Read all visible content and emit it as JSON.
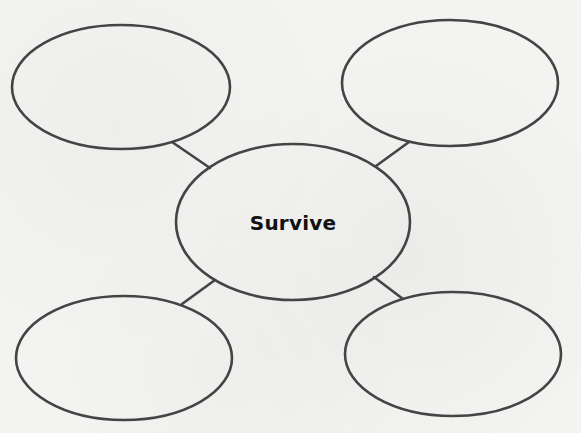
{
  "diagram": {
    "type": "bubble-map",
    "stroke_color": "#444444",
    "background_color": "#f3f3f1",
    "center": {
      "label": "Survive",
      "cx": 293,
      "cy": 222,
      "rx": 117,
      "ry": 78
    },
    "bubbles": [
      {
        "id": "top-left",
        "label": "",
        "cx": 121,
        "cy": 87,
        "rx": 109,
        "ry": 62
      },
      {
        "id": "top-right",
        "label": "",
        "cx": 450,
        "cy": 83,
        "rx": 108,
        "ry": 63
      },
      {
        "id": "bottom-left",
        "label": "",
        "cx": 124,
        "cy": 358,
        "rx": 108,
        "ry": 62
      },
      {
        "id": "bottom-right",
        "label": "",
        "cx": 453,
        "cy": 354,
        "rx": 108,
        "ry": 62
      }
    ],
    "connectors": [
      {
        "from": "top-left",
        "x1": 172,
        "y1": 142,
        "x2": 210,
        "y2": 168
      },
      {
        "from": "top-right",
        "x1": 409,
        "y1": 142,
        "x2": 376,
        "y2": 166
      },
      {
        "from": "bottom-left",
        "x1": 182,
        "y1": 304,
        "x2": 215,
        "y2": 280
      },
      {
        "from": "bottom-right",
        "x1": 403,
        "y1": 299,
        "x2": 374,
        "y2": 277
      }
    ]
  }
}
